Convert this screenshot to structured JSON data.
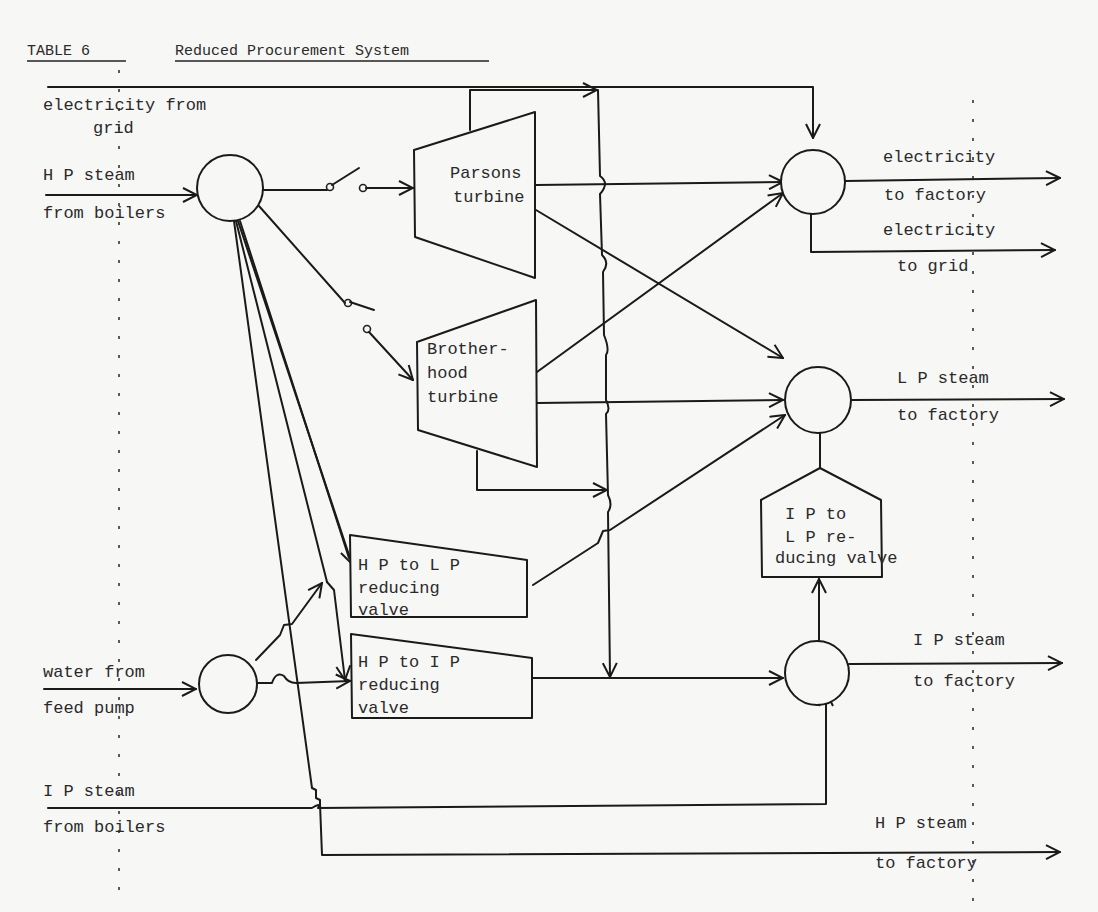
{
  "title": {
    "table_label": "TABLE 6",
    "caption": "Reduced Procurement System"
  },
  "inputs": {
    "electricity_grid": [
      "electricity from",
      "grid"
    ],
    "hp_steam_boilers": [
      "H P steam",
      "from boilers"
    ],
    "water_feed_pump": [
      "water from",
      "feed pump"
    ],
    "ip_steam_boilers": [
      "I P steam",
      "from boilers"
    ]
  },
  "units": {
    "parsons": [
      "Parsons",
      "turbine"
    ],
    "brotherhood": [
      "Brother-",
      "hood",
      "turbine"
    ],
    "hp_lp_valve": [
      "H P to L P",
      "reducing",
      "valve"
    ],
    "hp_ip_valve": [
      "H P to I P",
      "reducing",
      "valve"
    ],
    "ip_lp_valve": [
      "I P to",
      "L P re-",
      "ducing valve"
    ]
  },
  "outputs": {
    "electricity_factory": [
      "electricity",
      "to factory"
    ],
    "electricity_grid": [
      "electricity",
      "to grid"
    ],
    "lp_steam_factory": [
      "L P steam",
      "to factory"
    ],
    "ip_steam_factory": [
      "I P steam",
      "to factory"
    ],
    "hp_steam_factory": [
      "H P steam",
      "to factory"
    ]
  },
  "colors": {
    "ink": "#1a1a1a",
    "paper": "#f7f7f5"
  }
}
